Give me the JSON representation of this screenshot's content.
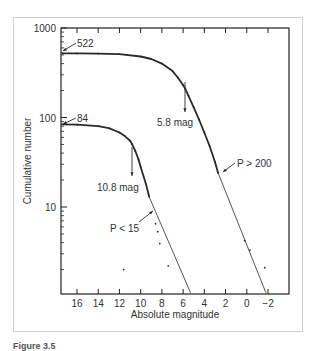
{
  "chart_data": {
    "type": "line",
    "title": "",
    "xlabel": "Absolute magnitude",
    "ylabel": "Cumulative number",
    "xscale": "linear",
    "yscale": "log",
    "xlim": [
      17.5,
      -3.5
    ],
    "ylim": [
      1.1,
      1000
    ],
    "x_ticks": [
      16,
      14,
      12,
      10,
      8,
      6,
      4,
      2,
      0,
      -2
    ],
    "x_tick_labels": [
      "16",
      "14",
      "12",
      "10",
      "8",
      "6",
      "4",
      "2",
      "0",
      "−2"
    ],
    "y_ticks": [
      10,
      100,
      1000
    ],
    "y_tick_labels": [
      "10",
      "100",
      "1000"
    ],
    "grid": false,
    "series": [
      {
        "name": "Large-period population (P > 200)",
        "start_value": 522,
        "turnover_mag": 5.8,
        "x": [
          17.4,
          16,
          14,
          12,
          10,
          9,
          8,
          7,
          6.5,
          6,
          5.8,
          5.5,
          5,
          4.5,
          4,
          3.5,
          3.0,
          2.7
        ],
        "y": [
          522,
          520,
          518,
          510,
          480,
          450,
          400,
          330,
          280,
          230,
          210,
          175,
          130,
          95,
          68,
          48,
          32,
          24
        ],
        "fit_line": {
          "x": [
            2.7,
            -1.8
          ],
          "y": [
            24,
            1.1
          ]
        },
        "scatter_tail": {
          "x": [
            0.2,
            -0.3,
            -1.7
          ],
          "y": [
            4.2,
            3.3,
            2.1
          ]
        }
      },
      {
        "name": "Small-period population (P < 15)",
        "start_value": 84,
        "turnover_mag": 10.8,
        "x": [
          17.4,
          16,
          14,
          13,
          12,
          11.5,
          11,
          10.8,
          10.5,
          10.2,
          10,
          9.5,
          9.2
        ],
        "y": [
          84,
          83,
          80,
          76,
          68,
          62,
          55,
          50,
          42,
          34,
          28,
          18,
          13
        ],
        "fit_line": {
          "x": [
            9.2,
            5.3
          ],
          "y": [
            13,
            1.1
          ]
        },
        "scatter_tail": {
          "x": [
            8.6,
            8.4,
            8.2,
            7.4,
            11.6
          ],
          "y": [
            6.5,
            5.3,
            3.9,
            2.2,
            2.0
          ]
        }
      }
    ],
    "annotations": [
      {
        "text": "522",
        "target": "upper curve start"
      },
      {
        "text": "84",
        "target": "lower curve start"
      },
      {
        "text": "5.8 mag",
        "target": "upper curve turnover (down arrow)"
      },
      {
        "text": "10.8 mag",
        "target": "lower curve turnover (down arrow)"
      },
      {
        "text": "P > 200",
        "target": "upper curve line-fit start"
      },
      {
        "text": "P < 15",
        "target": "lower curve line-fit start"
      }
    ]
  },
  "labels": {
    "xlabel": "Absolute magnitude",
    "ylabel": "Cumulative number",
    "ann_522": "522",
    "ann_84": "84",
    "ann_58": "5.8 mag",
    "ann_108": "10.8 mag",
    "ann_p200": "P > 200",
    "ann_p15": "P < 15",
    "caption": "Figure 3.5"
  },
  "colors": {
    "axis": "#222222",
    "curve": "#2a2a2a",
    "text": "#333333",
    "frame": "#cfcfcf"
  }
}
